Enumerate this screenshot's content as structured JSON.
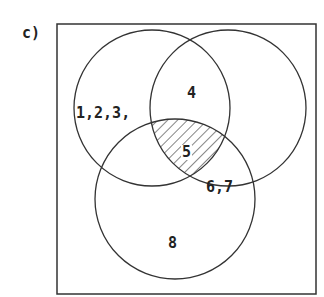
{
  "part_label": "c)",
  "regions": {
    "a_only": "1,2,3,",
    "ab_only": "4",
    "abc": "5",
    "bc_only": "6,7",
    "c_only": "8"
  },
  "shaded_region": "abc",
  "colors": {
    "stroke": "#333333",
    "hatch": "#333333",
    "background": "#ffffff"
  }
}
